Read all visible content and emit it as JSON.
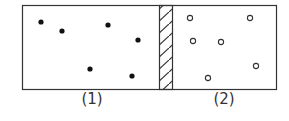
{
  "diagram": {
    "chambers": [
      {
        "label": "(1)",
        "particle_style": "filled",
        "particles": [
          [
            41,
            22
          ],
          [
            62,
            31
          ],
          [
            108,
            25
          ],
          [
            138,
            40
          ],
          [
            90,
            69
          ],
          [
            132,
            76
          ]
        ]
      },
      {
        "label": "(2)",
        "particle_style": "hollow",
        "particles": [
          [
            190,
            18
          ],
          [
            250,
            18
          ],
          [
            193,
            41
          ],
          [
            221,
            42
          ],
          [
            256,
            66
          ],
          [
            208,
            78
          ]
        ]
      }
    ],
    "partition": {
      "type": "hatched-wall"
    },
    "colors": {
      "stroke": "#333333",
      "fill": "#111111",
      "background": "#ffffff"
    }
  }
}
